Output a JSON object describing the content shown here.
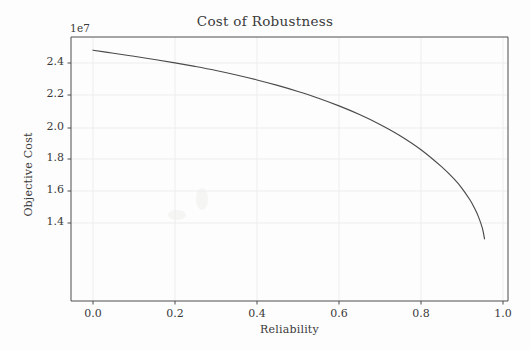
{
  "figure": {
    "title": "Cost of Robustness",
    "y_offset_text": "1e7",
    "xlabel": "Reliability",
    "ylabel": "Objective Cost",
    "line_color": "#4a4a4a",
    "grid_color": "#ededed",
    "axis_color": "#4d4d4d",
    "background_color": "#fdfdfd"
  },
  "chart_data": {
    "type": "line",
    "title": "Cost of Robustness",
    "xlabel": "Reliability",
    "ylabel": "Objective Cost",
    "y_offset": "1e7",
    "xlim": [
      -0.05,
      1.05
    ],
    "ylim": [
      12900000,
      25600000
    ],
    "grid": true,
    "legend": null,
    "xticks": [
      0.0,
      0.2,
      0.4,
      0.6,
      0.8,
      1.0
    ],
    "xtick_labels": [
      "0.0",
      "0.2",
      "0.4",
      "0.6",
      "0.8",
      "1.0"
    ],
    "yticks": [
      14000000,
      16000000,
      18000000,
      20000000,
      22000000,
      24000000
    ],
    "ytick_labels": [
      "1.4",
      "1.6",
      "1.8",
      "2.0",
      "2.2",
      "2.4"
    ],
    "series": [
      {
        "name": "Objective Cost vs Reliability",
        "x": [
          0.0,
          0.05,
          0.1,
          0.15,
          0.2,
          0.25,
          0.3,
          0.35,
          0.4,
          0.45,
          0.5,
          0.55,
          0.6,
          0.65,
          0.7,
          0.75,
          0.8,
          0.85,
          0.88,
          0.9,
          0.92,
          0.93,
          0.94,
          0.95,
          0.955
        ],
        "y": [
          13200000,
          13390000,
          13580000,
          13780000,
          13990000,
          14220000,
          14470000,
          14750000,
          15060000,
          15400000,
          15780000,
          16200000,
          16680000,
          17220000,
          17840000,
          18560000,
          19420000,
          20480000,
          21230000,
          21830000,
          22580000,
          23050000,
          23600000,
          24350000,
          25000000
        ]
      }
    ]
  },
  "yticks_px": [
    {
      "label": "2.4",
      "y": 63
    },
    {
      "label": "2.2",
      "y": 95
    },
    {
      "label": "2.0",
      "y": 128
    },
    {
      "label": "1.8",
      "y": 159
    },
    {
      "label": "1.6",
      "y": 191
    },
    {
      "label": "1.4",
      "y": 223
    }
  ],
  "xticks_px": [
    {
      "label": "0.0",
      "x": 93
    },
    {
      "label": "0.2",
      "x": 175
    },
    {
      "label": "0.4",
      "x": 257
    },
    {
      "label": "0.6",
      "x": 339
    },
    {
      "label": "0.8",
      "x": 421
    },
    {
      "label": "1.0",
      "x": 503
    }
  ]
}
